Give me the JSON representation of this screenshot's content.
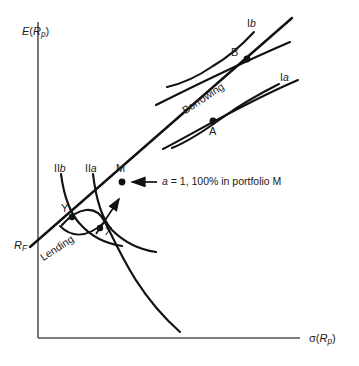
{
  "figure": {
    "kind": "capital-market-line-diagram",
    "background_color": "#ffffff",
    "ink_color": "#111111",
    "axis_color": "#555555",
    "width": 359,
    "height": 366
  },
  "axes": {
    "y_label_prefix": "E",
    "y_label_open": "(",
    "y_label_var": "R",
    "y_label_sub": "p",
    "y_label_close": ")",
    "y_label_full": "E (Rp)",
    "x_label_prefix": "σ",
    "x_label_open": "(",
    "x_label_var": "R",
    "x_label_sub": "p",
    "x_label_close": ")",
    "x_label_full": "σ(Rp)",
    "origin_x": 38,
    "origin_y": 338,
    "y_top": 22,
    "x_right": 300
  },
  "intercept": {
    "label_var": "R",
    "label_sub": "F",
    "label_full": "RF",
    "x": 14,
    "y": 246
  },
  "points": [
    {
      "name": "Y",
      "label": "Y",
      "x": 72,
      "y": 216,
      "label_dx": -11,
      "label_dy": -13
    },
    {
      "name": "X",
      "label": "X",
      "x": 100,
      "y": 228,
      "label_dx": 5,
      "label_dy": -2
    },
    {
      "name": "M",
      "label": "M",
      "x": 122,
      "y": 181,
      "label_dx": -4,
      "label_dy": -16
    },
    {
      "name": "A",
      "label": "A",
      "x": 213,
      "y": 120,
      "label_dx": -3,
      "label_dy": 6
    },
    {
      "name": "B",
      "label": "B",
      "x": 247,
      "y": 58,
      "label_dx": -16,
      "label_dy": -11
    }
  ],
  "curve_labels": [
    {
      "name": "indifference-IIb",
      "text": "II",
      "italic_suffix": "b",
      "x": 56,
      "y": 166
    },
    {
      "name": "indifference-IIa",
      "text": "II",
      "italic_suffix": "a",
      "x": 87,
      "y": 166
    },
    {
      "name": "indifference-Ia",
      "text": "I",
      "italic_suffix": "a",
      "x": 282,
      "y": 76
    },
    {
      "name": "indifference-Ib",
      "text": "I",
      "italic_suffix": "b",
      "x": 249,
      "y": 22
    }
  ],
  "region_labels": [
    {
      "name": "lending-label",
      "text": "Lending",
      "x": 46,
      "y": 262,
      "rotation": -33
    },
    {
      "name": "borrowing-label",
      "text": "Borrowing",
      "x": 190,
      "y": 108,
      "rotation": -33
    }
  ],
  "annotation": {
    "name": "portfolio-m-annotation",
    "italic_part": "a",
    "rest_text": " = 1, 100% in portfolio M",
    "full_text": "a = 1, 100% in portfolio M",
    "text_x": 160,
    "text_y": 179,
    "arrow_from_x": 157,
    "arrow_from_y": 182,
    "arrow_to_x": 130,
    "arrow_to_y": 182
  },
  "direction_arrow": {
    "name": "increasing-utility-arrow",
    "description": "curved arrow pointing up-right toward M"
  },
  "geometry": {
    "cml_start_x": 30,
    "cml_start_y": 246,
    "cml_end_x": 290,
    "cml_end_y": 20,
    "efficient_frontier": "M 62 225 C 78 208 95 205 104 222 C 118 248 135 292 178 330",
    "lower_frontier_arc": "M 62 225 C 72 234 86 238 104 222",
    "ind_IIb": "M 60 172 C 64 196 69 213 80 224 C 92 236 106 242 118 244",
    "ind_IIa": "M 92 172 C 95 197 99 216 110 228 C 122 241 139 248 152 250",
    "ind_Ia": "M 278 82 C 258 92 236 106 221 117 C 203 130 186 141 172 147",
    "ind_Ib": "M 253 30 C 240 44 226 56 212 65 C 196 76 180 82 166 85",
    "tangent_A": "M 165 148 C 195 132 240 105 296 80",
    "tangent_B": "M 158 104 C 190 88 232 66 288 40"
  }
}
